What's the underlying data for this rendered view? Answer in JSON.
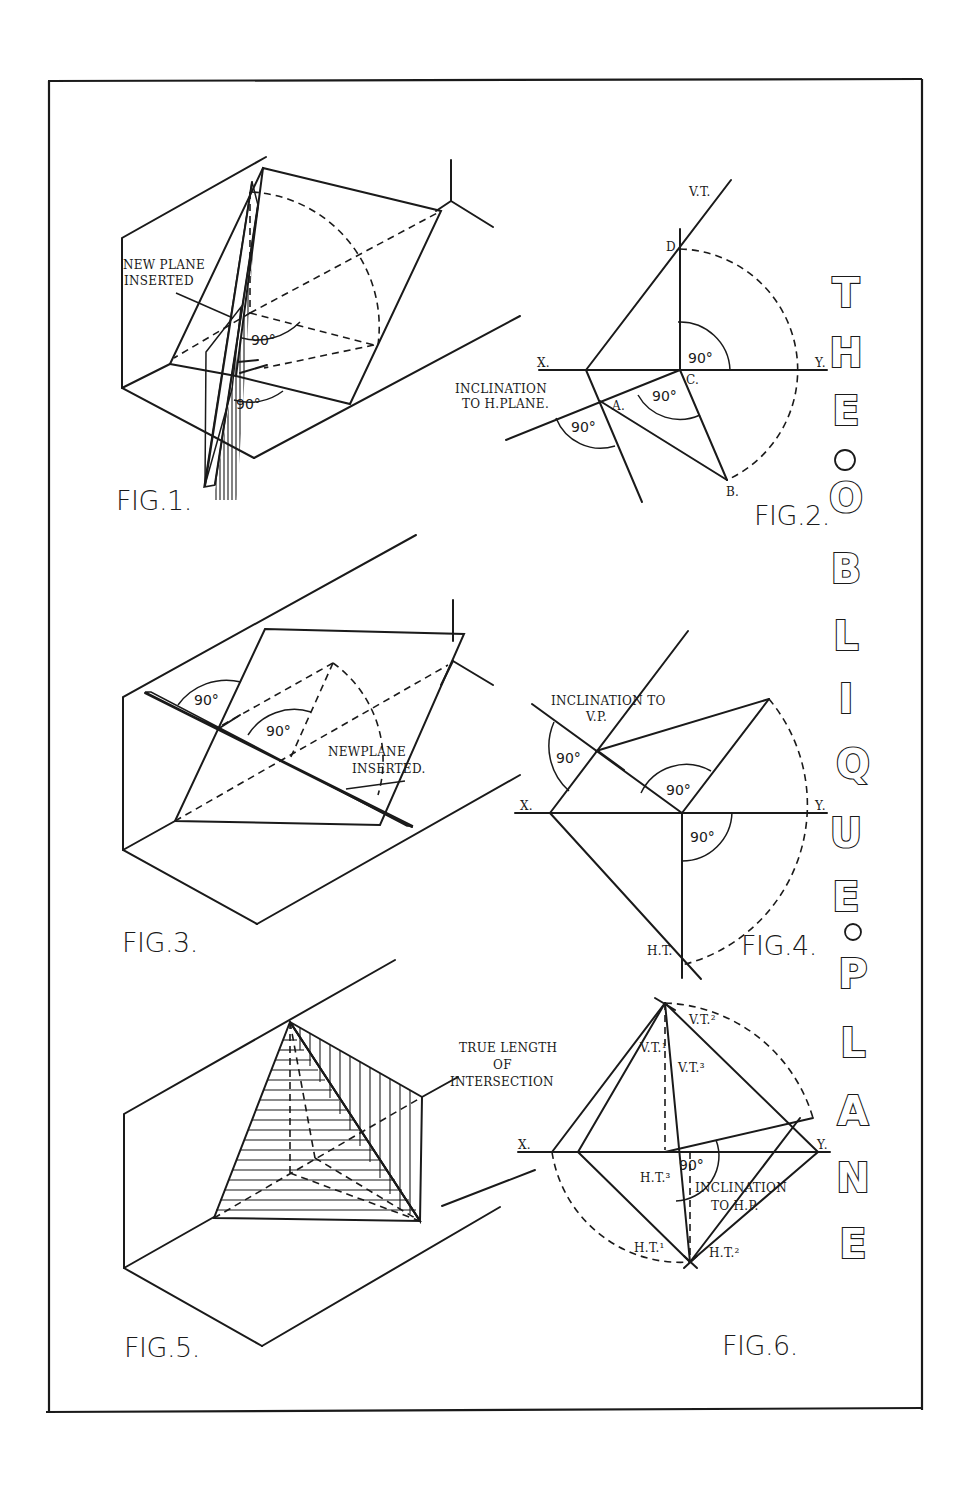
{
  "plate": {
    "title_letters": [
      "T",
      "H",
      "E",
      "○",
      "O",
      "B",
      "L",
      "I",
      "Q",
      "U",
      "E",
      "○",
      "P",
      "L",
      "A",
      "N",
      "E"
    ],
    "title_text": "THE OBLIQUE PLANE",
    "frame_color": "#1a1a1a",
    "paper_color": "#ffffff"
  },
  "figures": [
    {
      "caption": "FIG.1.",
      "labels": {
        "note_line1": "NEW PLANE",
        "note_line2": "INSERTED",
        "angle_a": "90°",
        "angle_b": "90°"
      }
    },
    {
      "caption": "FIG.2.",
      "labels": {
        "vt": "V.T.",
        "d": "D.",
        "x": "X.",
        "y": "Y.",
        "c": "C.",
        "a": "A.",
        "b": "B.",
        "incl_line1": "INCLINATION",
        "incl_line2": "TO H.PLANE.",
        "angle_top": "90°",
        "angle_mid": "90°",
        "angle_low": "90°"
      }
    },
    {
      "caption": "FIG.3.",
      "labels": {
        "note_line1": "NEWPLANE",
        "note_line2": "INSERTED.",
        "angle_a": "90°",
        "angle_b": "90°"
      }
    },
    {
      "caption": "FIG.4.",
      "labels": {
        "incl_line1": "INCLINATION TO",
        "incl_line2": "V.P.",
        "x": "X.",
        "y": "Y.",
        "ht": "H.T.",
        "angle_left": "90°",
        "angle_mid": "90°",
        "angle_low": "90°"
      }
    },
    {
      "caption": "FIG.5.",
      "labels": {}
    },
    {
      "caption": "FIG.6.",
      "labels": {
        "tl_line1": "TRUE LENGTH",
        "tl_line2": "OF",
        "tl_line3": "INTERSECTION",
        "vt1": "V.T.¹",
        "vt2": "V.T.²",
        "vt3": "V.T.³",
        "ht1": "H.T.¹",
        "ht2": "H.T.²",
        "ht3": "H.T.³",
        "x": "X.",
        "y": "Y.",
        "angle": "90°",
        "incl_line1": "INCLINATION",
        "incl_line2": "TO H.P."
      }
    }
  ]
}
